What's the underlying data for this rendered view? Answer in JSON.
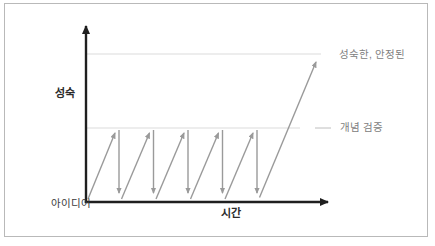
{
  "figure": {
    "caption_fragment": "그림 1-1",
    "labels": {
      "y_axis": "성숙",
      "x_axis": "시간",
      "origin": "아이디어",
      "mature_stable": "성숙한, 안정된",
      "proof_of_concept": "개념 검증"
    },
    "diagram": {
      "type": "diagram",
      "iteration_count": 5,
      "description": "Repeated idea iterations rise to the proof-of-concept level and fall back, until a final long arrow rises to the mature/stable level",
      "colors": {
        "axis": "#1f1f1f",
        "arrow_gray": "#9a9a9a",
        "guide_line": "#dcdcdc",
        "label_gray": "#808080",
        "label_dark": "#2b2b2b",
        "border": "#b9b9b9"
      }
    }
  }
}
